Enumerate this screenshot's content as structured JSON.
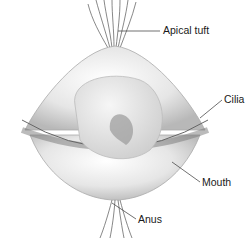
{
  "diagram": {
    "labels": [
      {
        "id": "apical-tuft",
        "text": "Apical tuft"
      },
      {
        "id": "cilia",
        "text": "Cilia"
      },
      {
        "id": "mouth",
        "text": "Mouth"
      },
      {
        "id": "anus",
        "text": "Anus"
      }
    ]
  }
}
